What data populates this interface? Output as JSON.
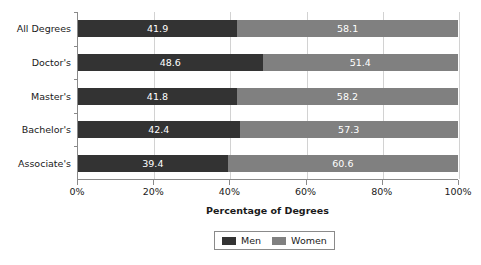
{
  "chart_data": {
    "type": "bar",
    "orientation": "horizontal",
    "stacked": true,
    "stack_total": 100,
    "title": "",
    "xlabel": "Percentage of Degrees",
    "ylabel": "",
    "xlim": [
      0,
      100
    ],
    "xticks": [
      0,
      20,
      40,
      60,
      80,
      100
    ],
    "xtick_labels": [
      "0%",
      "20%",
      "40%",
      "60%",
      "80%",
      "100%"
    ],
    "grid": true,
    "grid_axis": "x",
    "legend_position": "bottom",
    "categories": [
      "All Degrees",
      "Doctor's",
      "Master's",
      "Bachelor's",
      "Associate's"
    ],
    "series": [
      {
        "name": "Men",
        "color": "#333333",
        "values": [
          41.9,
          48.6,
          41.8,
          42.4,
          39.4
        ],
        "labels": [
          "41.9",
          "48.6",
          "41.8",
          "42.4",
          "39.4"
        ]
      },
      {
        "name": "Women",
        "color": "#808080",
        "values": [
          58.1,
          51.4,
          58.2,
          57.3,
          60.6
        ],
        "labels": [
          "58.1",
          "51.4",
          "58.2",
          "57.3",
          "60.6"
        ]
      }
    ]
  },
  "legend": {
    "entries": [
      {
        "label": "Men",
        "color": "#333333"
      },
      {
        "label": "Women",
        "color": "#808080"
      }
    ]
  },
  "axis": {
    "x_title": "Percentage of Degrees"
  },
  "colors": {
    "men": "#333333",
    "women": "#808080",
    "axis_line": "#8a8a8a",
    "gridline": "#d2d2d2",
    "text": "#1a1a1a",
    "bar_label_text": "#ffffff",
    "background": "#ffffff"
  }
}
